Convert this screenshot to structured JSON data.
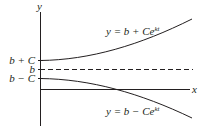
{
  "diagram": {
    "axes": {
      "x_label": "x",
      "y_label": "y"
    },
    "tick_labels": {
      "b_plus_c": "b + C",
      "b": "b",
      "b_minus_c": "b − C"
    },
    "curves": [
      {
        "name": "upper",
        "label_prefix": "y = b + Ce",
        "label_exponent": "kt"
      },
      {
        "name": "lower",
        "label_prefix": "y = b − Ce",
        "label_exponent": "kt"
      }
    ],
    "asymptote": {
      "style": "dashed",
      "value_label": "b"
    },
    "colors": {
      "ink": "#231f20",
      "background": "#ffffff"
    }
  }
}
